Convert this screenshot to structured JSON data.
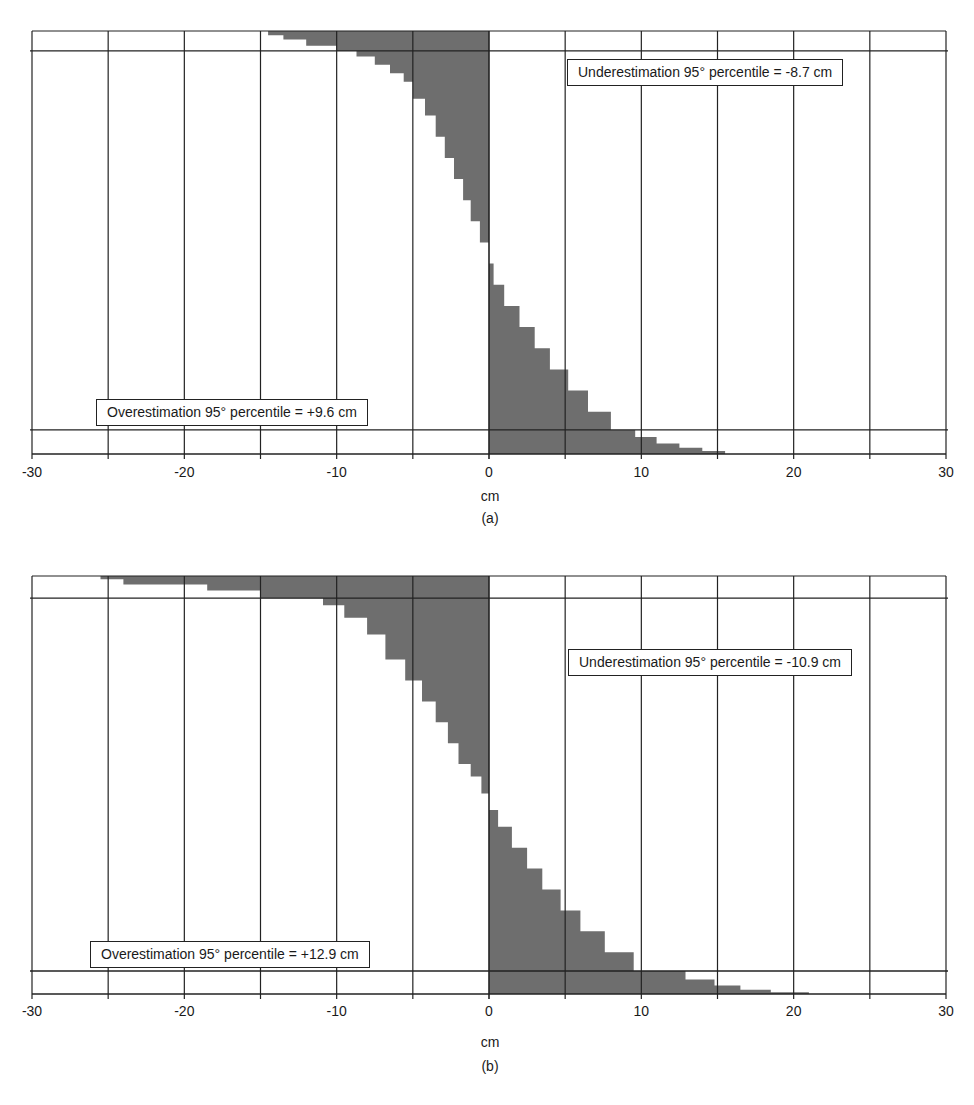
{
  "colors": {
    "fill": "#6e6e6e",
    "grid": "#222222",
    "background": "#ffffff"
  },
  "chart_data": [
    {
      "type": "area",
      "id": "a",
      "title": "",
      "caption": "(a)",
      "xlabel": "cm",
      "ylabel": "",
      "xlim": [
        -30,
        30
      ],
      "xticks": [
        -30,
        -20,
        -10,
        0,
        10,
        20,
        30
      ],
      "x_gridlines_every": 5,
      "grid": true,
      "description": "Sorted error distribution (cm) with 95th percentile lines for underestimation and overestimation",
      "annotations": [
        {
          "text": "Underestimation 95° percentile = -8.7 cm",
          "value": -8.7
        },
        {
          "text": "Overestimation 95° percentile = +9.6 cm",
          "value": 9.6
        }
      ],
      "percentile_lines_frac": [
        0.047,
        0.943
      ],
      "profile": {
        "frac": [
          0.0,
          0.01,
          0.02,
          0.035,
          0.047,
          0.06,
          0.08,
          0.1,
          0.12,
          0.16,
          0.2,
          0.25,
          0.3,
          0.35,
          0.4,
          0.45,
          0.5,
          0.55,
          0.6,
          0.65,
          0.7,
          0.75,
          0.8,
          0.85,
          0.9,
          0.943,
          0.96,
          0.975,
          0.985,
          0.993,
          1.0
        ],
        "values": [
          -14.5,
          -13.5,
          -12,
          -10,
          -8.7,
          -7.5,
          -6.5,
          -5.6,
          -5.0,
          -4.2,
          -3.5,
          -2.9,
          -2.3,
          -1.7,
          -1.2,
          -0.6,
          0.0,
          0.3,
          1.0,
          2.0,
          3.0,
          4.0,
          5.2,
          6.5,
          8.0,
          9.6,
          11.0,
          12.5,
          14.0,
          15.5,
          20.0
        ]
      }
    },
    {
      "type": "area",
      "id": "b",
      "title": "",
      "caption": "(b)",
      "xlabel": "cm",
      "ylabel": "",
      "xlim": [
        -30,
        30
      ],
      "xticks": [
        -30,
        -20,
        -10,
        0,
        10,
        20,
        30
      ],
      "x_gridlines_every": 5,
      "grid": true,
      "description": "Sorted error distribution (cm) with 95th percentile lines for underestimation and overestimation",
      "annotations": [
        {
          "text": "Underestimation 95° percentile = -10.9 cm",
          "value": -10.9
        },
        {
          "text": "Overestimation 95° percentile = +12.9 cm",
          "value": 12.9
        }
      ],
      "percentile_lines_frac": [
        0.053,
        0.945
      ],
      "profile": {
        "frac": [
          0.0,
          0.008,
          0.02,
          0.035,
          0.053,
          0.07,
          0.1,
          0.14,
          0.2,
          0.25,
          0.3,
          0.35,
          0.4,
          0.45,
          0.48,
          0.52,
          0.56,
          0.6,
          0.65,
          0.7,
          0.75,
          0.8,
          0.85,
          0.9,
          0.945,
          0.965,
          0.98,
          0.99,
          0.996,
          1.0
        ],
        "values": [
          -25.5,
          -24,
          -18.5,
          -15,
          -10.9,
          -9.5,
          -8.0,
          -6.8,
          -5.5,
          -4.4,
          -3.5,
          -2.7,
          -2.0,
          -1.2,
          -0.5,
          0.0,
          0.6,
          1.5,
          2.5,
          3.5,
          4.7,
          6.0,
          7.6,
          9.5,
          12.9,
          14.8,
          16.5,
          18.5,
          21.0,
          23.0
        ]
      }
    }
  ]
}
